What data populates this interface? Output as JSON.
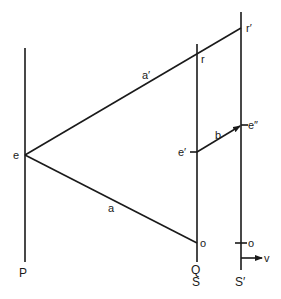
{
  "diagram": {
    "type": "geometric-optics-light-rays",
    "colors": {
      "ink": "#1a1a1a",
      "background": "#ffffff"
    },
    "vertical_lines": [
      {
        "id": "P",
        "label": "P"
      },
      {
        "id": "QS",
        "label_top": "Q",
        "label_bottom": "S"
      },
      {
        "id": "Sprime",
        "label": "S′"
      }
    ],
    "points": {
      "e": "e",
      "e_prime": "e′",
      "e_double_prime": "e″",
      "r": "r",
      "r_prime": "r′",
      "o_qs": "o",
      "o_sprime": "o"
    },
    "segments": {
      "a": "a",
      "a_prime": "a′",
      "b": "b"
    },
    "velocity_label": "v"
  }
}
